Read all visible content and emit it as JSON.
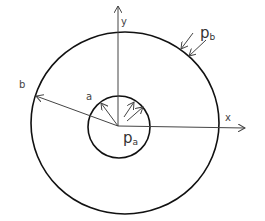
{
  "diagram": {
    "type": "thick-walled cylinder cross-section",
    "labels": {
      "y_axis": "y",
      "x_axis": "x",
      "outer_radius": "b",
      "inner_radius": "a",
      "inner_pressure_main": "p",
      "inner_pressure_sub": "a",
      "outer_pressure_main": "p",
      "outer_pressure_sub": "b"
    },
    "colors": {
      "stroke": "#111111",
      "thin": "#444444"
    }
  }
}
